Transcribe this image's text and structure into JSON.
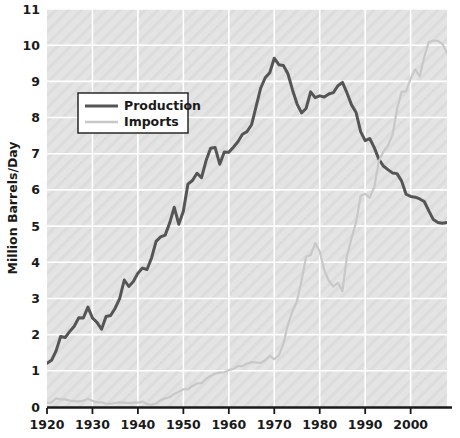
{
  "chart_data": {
    "type": "line",
    "title": "",
    "xlabel": "",
    "ylabel": "Million Barrels/Day",
    "xlim": [
      1920,
      2008
    ],
    "ylim": [
      0,
      11
    ],
    "xticks": [
      1920,
      1930,
      1940,
      1950,
      1960,
      1970,
      1980,
      1990,
      2000
    ],
    "xticklabels": [
      "1920",
      "1930",
      "1940",
      "1950",
      "1960",
      "1970",
      "1980",
      "1990",
      "2000"
    ],
    "yticks": [
      0,
      1,
      2,
      3,
      4,
      5,
      6,
      7,
      8,
      9,
      10,
      11
    ],
    "yticklabels": [
      "0",
      "1",
      "2",
      "3",
      "4",
      "5",
      "6",
      "7",
      "8",
      "9",
      "10",
      "11"
    ],
    "grid": true,
    "grid_color": "#ffffff",
    "plot_bg": "#e2e2e2",
    "legend_position": "upper-left",
    "series": [
      {
        "name": "Production",
        "color": "#555555",
        "width": 3.0,
        "x": [
          1920,
          1921,
          1922,
          1923,
          1924,
          1925,
          1926,
          1927,
          1928,
          1929,
          1930,
          1931,
          1932,
          1933,
          1934,
          1935,
          1936,
          1937,
          1938,
          1939,
          1940,
          1941,
          1942,
          1943,
          1944,
          1945,
          1946,
          1947,
          1948,
          1949,
          1950,
          1951,
          1952,
          1953,
          1954,
          1955,
          1956,
          1957,
          1958,
          1959,
          1960,
          1961,
          1962,
          1963,
          1964,
          1965,
          1966,
          1967,
          1968,
          1969,
          1970,
          1971,
          1972,
          1973,
          1974,
          1975,
          1976,
          1977,
          1978,
          1979,
          1980,
          1981,
          1982,
          1983,
          1984,
          1985,
          1986,
          1987,
          1988,
          1989,
          1990,
          1991,
          1992,
          1993,
          1994,
          1995,
          1996,
          1997,
          1998,
          1999,
          2000,
          2001,
          2002,
          2003,
          2004,
          2005,
          2006,
          2007,
          2008
        ],
        "values": [
          1.21,
          1.29,
          1.55,
          1.95,
          1.92,
          2.09,
          2.23,
          2.47,
          2.46,
          2.76,
          2.46,
          2.34,
          2.15,
          2.5,
          2.53,
          2.73,
          3.0,
          3.51,
          3.33,
          3.47,
          3.7,
          3.84,
          3.8,
          4.12,
          4.58,
          4.7,
          4.75,
          5.09,
          5.52,
          5.05,
          5.41,
          6.16,
          6.26,
          6.46,
          6.34,
          6.81,
          7.15,
          7.17,
          6.71,
          7.05,
          7.04,
          7.18,
          7.33,
          7.54,
          7.61,
          7.8,
          8.3,
          8.81,
          9.1,
          9.24,
          9.64,
          9.46,
          9.44,
          9.21,
          8.77,
          8.38,
          8.13,
          8.25,
          8.71,
          8.55,
          8.6,
          8.57,
          8.65,
          8.69,
          8.88,
          8.97,
          8.68,
          8.35,
          8.14,
          7.61,
          7.36,
          7.42,
          7.17,
          6.85,
          6.66,
          6.56,
          6.47,
          6.45,
          6.25,
          5.88,
          5.82,
          5.8,
          5.75,
          5.68,
          5.42,
          5.18,
          5.1,
          5.08,
          5.1
        ]
      },
      {
        "name": "Imports",
        "color": "#c8c8c8",
        "width": 2.2,
        "x": [
          1920,
          1921,
          1922,
          1923,
          1924,
          1925,
          1926,
          1927,
          1928,
          1929,
          1930,
          1931,
          1932,
          1933,
          1934,
          1935,
          1936,
          1937,
          1938,
          1939,
          1940,
          1941,
          1942,
          1943,
          1944,
          1945,
          1946,
          1947,
          1948,
          1949,
          1950,
          1951,
          1952,
          1953,
          1954,
          1955,
          1956,
          1957,
          1958,
          1959,
          1960,
          1961,
          1962,
          1963,
          1964,
          1965,
          1966,
          1967,
          1968,
          1969,
          1970,
          1971,
          1972,
          1973,
          1974,
          1975,
          1976,
          1977,
          1978,
          1979,
          1980,
          1981,
          1982,
          1983,
          1984,
          1985,
          1986,
          1987,
          1988,
          1989,
          1990,
          1991,
          1992,
          1993,
          1994,
          1995,
          1996,
          1997,
          1998,
          1999,
          2000,
          2001,
          2002,
          2003,
          2004,
          2005,
          2006,
          2007,
          2008
        ],
        "values": [
          0.11,
          0.13,
          0.24,
          0.21,
          0.21,
          0.18,
          0.16,
          0.15,
          0.18,
          0.22,
          0.17,
          0.13,
          0.13,
          0.09,
          0.09,
          0.11,
          0.13,
          0.12,
          0.11,
          0.12,
          0.12,
          0.15,
          0.08,
          0.06,
          0.1,
          0.19,
          0.24,
          0.27,
          0.36,
          0.42,
          0.49,
          0.49,
          0.58,
          0.65,
          0.66,
          0.78,
          0.86,
          0.92,
          0.95,
          0.96,
          1.02,
          1.05,
          1.13,
          1.13,
          1.2,
          1.24,
          1.23,
          1.22,
          1.29,
          1.41,
          1.32,
          1.43,
          1.74,
          2.28,
          2.64,
          2.93,
          3.49,
          4.15,
          4.2,
          4.53,
          4.3,
          3.78,
          3.49,
          3.33,
          3.43,
          3.2,
          4.18,
          4.67,
          5.11,
          5.84,
          5.89,
          5.78,
          6.08,
          6.79,
          7.06,
          7.23,
          7.51,
          8.23,
          8.71,
          8.73,
          9.07,
          9.33,
          9.14,
          9.67,
          10.09,
          10.13,
          10.12,
          10.03,
          9.78
        ]
      }
    ]
  },
  "legend": {
    "items": [
      {
        "label": "Production",
        "color": "#555555"
      },
      {
        "label": "Imports",
        "color": "#c8c8c8"
      }
    ]
  },
  "axes": {
    "y_title": "Million Barrels/Day"
  }
}
